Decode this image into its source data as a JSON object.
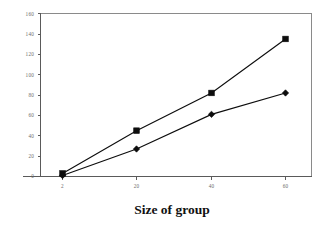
{
  "chart_data": {
    "type": "line",
    "title": "",
    "xlabel": "Size of group",
    "ylabel": "",
    "categories": [
      "2",
      "20",
      "40",
      "60"
    ],
    "x": [
      2,
      20,
      40,
      60
    ],
    "xtick_labels": [
      "2",
      "20",
      "40",
      "60"
    ],
    "ytick_labels": [
      "0",
      "20",
      "40",
      "60",
      "80",
      "100",
      "120",
      "140",
      "160"
    ],
    "yticks": [
      0,
      20,
      40,
      60,
      80,
      100,
      120,
      140,
      160
    ],
    "ylim": [
      0,
      160
    ],
    "grid": false,
    "legend": "none",
    "series": [
      {
        "name": "series-squares",
        "marker": "square",
        "color": "#0d0d0d",
        "values": [
          3,
          45,
          82,
          135
        ]
      },
      {
        "name": "series-diamonds",
        "marker": "diamond",
        "color": "#0d0d0d",
        "values": [
          1,
          27,
          61,
          82
        ]
      }
    ]
  },
  "axis": {
    "x_title": "Size of group"
  }
}
